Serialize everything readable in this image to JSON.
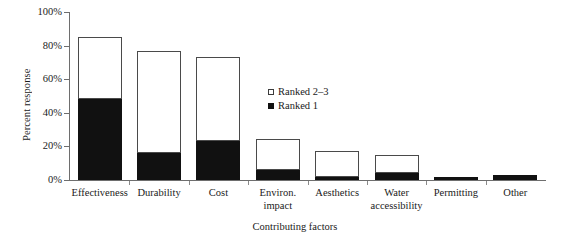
{
  "chart_data": {
    "type": "bar",
    "subtype": "stacked-vertical",
    "title": "",
    "xlabel": "Contributing factors",
    "ylabel": "Percent response",
    "ylim": [
      0,
      100
    ],
    "yticks": [
      0,
      20,
      40,
      60,
      80,
      100
    ],
    "ytick_labels": [
      "0%",
      "20%",
      "40%",
      "60%",
      "80%",
      "100%"
    ],
    "grid": false,
    "legend_position": "inside-center-right",
    "categories": [
      "Effectiveness",
      "Durability",
      "Cost",
      "Environ.\nimpact",
      "Aesthetics",
      "Water\naccessibility",
      "Permitting",
      "Other"
    ],
    "series": [
      {
        "name": "Ranked 1",
        "marker": "filled-square",
        "color": "#111111",
        "values": [
          48,
          16,
          23,
          6,
          2,
          4,
          2,
          3
        ]
      },
      {
        "name": "Ranked 2–3",
        "marker": "open-square",
        "color": "#ffffff",
        "values": [
          37,
          61,
          50.5,
          18.5,
          15,
          11,
          0,
          0
        ]
      }
    ],
    "totals": [
      85,
      77,
      73.5,
      24.5,
      17,
      15,
      2,
      3
    ]
  },
  "legend": {
    "items": [
      {
        "label": "Ranked 2–3",
        "swatch": "open-square"
      },
      {
        "label": "Ranked 1",
        "swatch": "filled-square"
      }
    ]
  },
  "axes": {
    "y_title": "Percent response",
    "x_title": "Contributing factors"
  }
}
